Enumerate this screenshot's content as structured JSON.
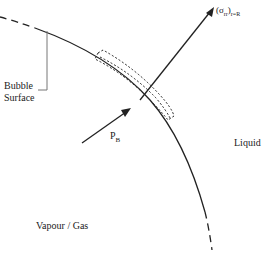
{
  "diagram": {
    "type": "bubble-interface-schematic",
    "labels": {
      "bubble_surface_line1": "Bubble",
      "bubble_surface_line2": "Surface",
      "pressure": "P",
      "pressure_sub": "B",
      "stress": "(σ",
      "stress_sub1": "rr",
      "stress_close": ")",
      "stress_sub2": "r=R",
      "liquid": "Liquid",
      "vapour": "Vapour / Gas"
    },
    "colors": {
      "line": "#222222",
      "leader": "#777777",
      "background": "#ffffff"
    }
  }
}
